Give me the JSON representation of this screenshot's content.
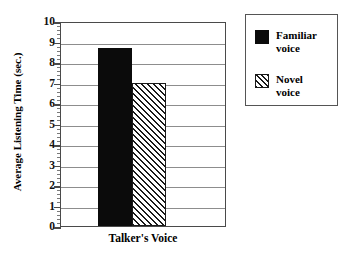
{
  "chart_data": {
    "type": "bar",
    "title": "",
    "xlabel": "Talker's Voice",
    "ylabel": "Average Listening Time (sec.)",
    "categories": [
      "Talker's Voice"
    ],
    "ylim": [
      0,
      10
    ],
    "ytick_labels": [
      "0",
      "1",
      "2",
      "3",
      "4",
      "5",
      "6",
      "7",
      "8",
      "9",
      "10"
    ],
    "ytick_values": [
      0,
      1,
      2,
      3,
      4,
      5,
      6,
      7,
      8,
      9,
      10
    ],
    "y_minor_ticks_between_majors": 4,
    "grid": "horizontal",
    "legend_position": "right-outside-box",
    "series": [
      {
        "name": "Familiar voice",
        "legend_label_line1": "Familiar",
        "legend_label_line2": "voice",
        "fill": "solid",
        "color": "#0b0b0b",
        "values": [
          8.7
        ]
      },
      {
        "name": "Novel voice",
        "legend_label_line1": "Novel",
        "legend_label_line2": "voice",
        "fill": "diagonal-hatch",
        "color": "#1a1a1a",
        "values": [
          7.0
        ]
      }
    ]
  }
}
